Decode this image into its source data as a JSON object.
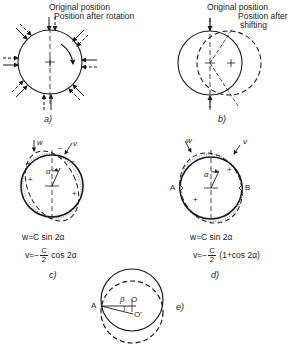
{
  "figure": {
    "panels": [
      {
        "id": "a",
        "caption": "a)",
        "labels": {
          "original": "Original position",
          "after": "Position after rotation"
        }
      },
      {
        "id": "b",
        "caption": "b)",
        "labels": {
          "original": "Original position",
          "after_line1": "Position after",
          "after_line2": "shifting"
        }
      },
      {
        "id": "c",
        "caption": "c)",
        "symbols": {
          "w": "w",
          "v": "v",
          "alpha": "α",
          "plus": "+",
          "minus": "−"
        },
        "equations": {
          "w": "w=C sin 2α",
          "v_prefix": "v=−",
          "v_num": "C",
          "v_den": "2",
          "v_suffix": "cos 2α"
        }
      },
      {
        "id": "d",
        "caption": "d)",
        "symbols": {
          "w": "w",
          "v": "v",
          "alpha": "α",
          "A": "A",
          "B": "B",
          "plus": "+"
        },
        "equations": {
          "w": "w=C sin 2α",
          "v_prefix": "v=−",
          "v_num": "C",
          "v_den": "2",
          "v_suffix": "(1+cos 2α)"
        }
      },
      {
        "id": "e",
        "caption": "e)",
        "symbols": {
          "A": "A",
          "beta": "β",
          "O": "O",
          "Oprime": "O'"
        }
      }
    ],
    "colors": {
      "ink": "#1a1a1a",
      "background": "#ffffff",
      "dotted": "#888888"
    }
  }
}
